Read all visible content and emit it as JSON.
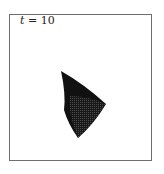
{
  "figure": {
    "label_var": "t",
    "label_rest": " = 10",
    "colors": {
      "frame": "#6e6e6e",
      "shape_dark": "#111111",
      "shape_mesh": "#3a3a3a",
      "background": "#ffffff"
    },
    "shape": {
      "description": "dark curved quadrilateral surface with mesh texture",
      "vertices": [
        [
          61,
          71
        ],
        [
          106,
          104
        ],
        [
          78,
          138
        ],
        [
          63,
          107
        ]
      ]
    }
  }
}
